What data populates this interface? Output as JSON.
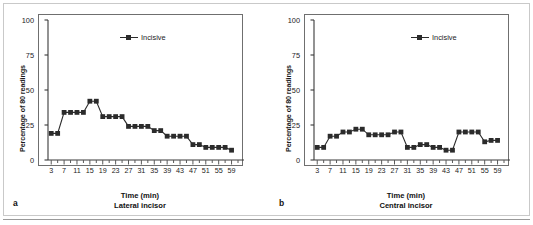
{
  "figure": {
    "background_color": "#ffffff",
    "frame_color": "#c9c9c9",
    "series_color": "#2b2b2b"
  },
  "chart_data": [
    {
      "type": "line",
      "panel_letter": "a",
      "title": "",
      "subtitle": "Lateral incisor",
      "xlabel": "Time (min)",
      "ylabel": "Percentage of 80 readings",
      "xlim": [
        2,
        61
      ],
      "ylim": [
        0,
        100
      ],
      "grid": false,
      "legend_position": "top-center",
      "xticks": [
        3,
        7,
        11,
        15,
        19,
        23,
        27,
        31,
        35,
        39,
        43,
        47,
        51,
        55,
        59
      ],
      "xtick_labels": [
        "3",
        "7",
        "11",
        "15",
        "19",
        "23",
        "27",
        "31",
        "35",
        "39",
        "43",
        "47",
        "51",
        "55",
        "59"
      ],
      "xminor_step": 2,
      "yticks": [
        0,
        25,
        50,
        75,
        100
      ],
      "ytick_labels": [
        "0",
        "25",
        "50",
        "75",
        "100"
      ],
      "series": [
        {
          "name": "Incisive",
          "marker": "square",
          "x": [
            3,
            5,
            7,
            9,
            11,
            13,
            15,
            17,
            19,
            21,
            23,
            25,
            27,
            29,
            31,
            33,
            35,
            37,
            39,
            41,
            43,
            45,
            47,
            49,
            51,
            53,
            55,
            57,
            59
          ],
          "values": [
            19,
            19,
            34,
            34,
            34,
            34,
            42,
            42,
            31,
            31,
            31,
            31,
            24,
            24,
            24,
            24,
            21,
            21,
            17,
            17,
            17,
            17,
            11,
            11,
            9,
            9,
            9,
            9,
            7
          ]
        }
      ]
    },
    {
      "type": "line",
      "panel_letter": "b",
      "title": "",
      "subtitle": "Central incisor",
      "xlabel": "Time (min)",
      "ylabel": "Percentage of 80 readings",
      "xlim": [
        2,
        61
      ],
      "ylim": [
        0,
        100
      ],
      "grid": false,
      "legend_position": "top-center",
      "xticks": [
        3,
        7,
        11,
        15,
        19,
        23,
        27,
        31,
        35,
        39,
        43,
        47,
        51,
        55,
        59
      ],
      "xtick_labels": [
        "3",
        "7",
        "11",
        "15",
        "19",
        "23",
        "27",
        "31",
        "35",
        "39",
        "43",
        "47",
        "51",
        "55",
        "59"
      ],
      "xminor_step": 2,
      "yticks": [
        0,
        25,
        50,
        75,
        100
      ],
      "ytick_labels": [
        "0",
        "25",
        "50",
        "75",
        "100"
      ],
      "series": [
        {
          "name": "Incisive",
          "marker": "square",
          "x": [
            3,
            5,
            7,
            9,
            11,
            13,
            15,
            17,
            19,
            21,
            23,
            25,
            27,
            29,
            31,
            33,
            35,
            37,
            39,
            41,
            43,
            45,
            47,
            49,
            51,
            53,
            55,
            57,
            59
          ],
          "values": [
            9,
            9,
            17,
            17,
            20,
            20,
            22,
            22,
            18,
            18,
            18,
            18,
            20,
            20,
            9,
            9,
            11,
            11,
            9,
            9,
            7,
            7,
            20,
            20,
            20,
            20,
            13,
            14,
            14
          ]
        }
      ]
    }
  ],
  "panels": [
    {
      "letter": "a",
      "xlabel": "Time (min)",
      "sublabel": "Lateral incisor",
      "ylabel": "Percentage of 80 readings",
      "legend_label": "Incisive"
    },
    {
      "letter": "b",
      "xlabel": "Time (min)",
      "sublabel": "Central incisor",
      "ylabel": "Percentage of 80 readings",
      "legend_label": "Incisive"
    }
  ]
}
